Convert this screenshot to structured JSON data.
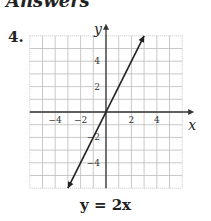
{
  "problem": {
    "number": "4.",
    "top_text_cropped": "Answers"
  },
  "equation": "y = 2x",
  "chart_data": {
    "type": "line",
    "title": "y = 2x",
    "xlabel": "x",
    "ylabel": "y",
    "xlim": [
      -6,
      6
    ],
    "ylim": [
      -6,
      6
    ],
    "grid": true,
    "x_ticks": [
      -4,
      -2,
      2,
      4
    ],
    "y_ticks": [
      -4,
      -2,
      2,
      4
    ],
    "x_tick_labels": [
      "−4",
      "−2",
      "2",
      "4"
    ],
    "y_tick_labels": [
      "−4",
      "−2",
      "2",
      "4"
    ],
    "series": [
      {
        "name": "y = 2x",
        "x": [
          -3,
          0,
          3
        ],
        "y": [
          -6,
          0,
          6
        ]
      }
    ],
    "arrows_both_ends": true
  }
}
